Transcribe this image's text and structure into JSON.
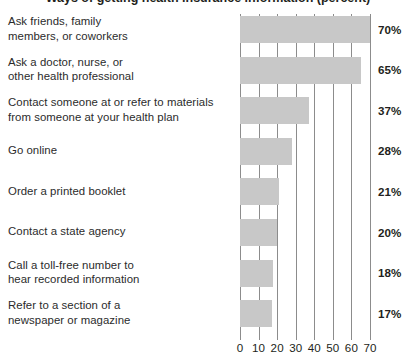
{
  "title": "Ways of getting health insurance information (percent)",
  "chart_data": {
    "type": "bar",
    "orientation": "horizontal",
    "title": "Ways of getting health insurance information (percent)",
    "xlabel": "",
    "ylabel": "",
    "xlim": [
      0,
      70
    ],
    "grid": true,
    "gridlines_x": [
      0,
      10,
      20,
      30,
      40,
      50,
      60,
      70
    ],
    "legend": "none",
    "bar_color": "#c8c8c8",
    "gridline_color": "#8c8c8c",
    "text_color": "#231f20",
    "xticks": [
      "0",
      "10",
      "20",
      "30",
      "40",
      "50",
      "60",
      "70"
    ],
    "categories": [
      "Ask friends, family members, or coworkers",
      "Ask a doctor, nurse, or other health professional",
      "Contact someone at or refer to materials from someone at your health plan",
      "Go online",
      "Order a printed booklet",
      "Contact a state agency",
      "Call a toll-free number to hear recorded information",
      "Refer to a section of a newspaper or magazine"
    ],
    "values": [
      70,
      65,
      37,
      28,
      21,
      20,
      18,
      17
    ],
    "value_labels": [
      "70%",
      "65%",
      "37%",
      "28%",
      "21%",
      "20%",
      "18%",
      "17%"
    ]
  },
  "rows": [
    {
      "label_lines": [
        "Ask friends, family",
        "members, or coworkers"
      ],
      "value": 70,
      "value_label": "70%"
    },
    {
      "label_lines": [
        "Ask a doctor, nurse, or",
        "other health professional"
      ],
      "value": 65,
      "value_label": "65%"
    },
    {
      "label_lines": [
        "Contact someone at or refer to materials",
        "from someone at your health plan"
      ],
      "value": 37,
      "value_label": "37%"
    },
    {
      "label_lines": [
        "Go online"
      ],
      "value": 28,
      "value_label": "28%"
    },
    {
      "label_lines": [
        "Order a printed booklet"
      ],
      "value": 21,
      "value_label": "21%"
    },
    {
      "label_lines": [
        "Contact a state agency"
      ],
      "value": 20,
      "value_label": "20%"
    },
    {
      "label_lines": [
        "Call a toll-free number to",
        "hear recorded information"
      ],
      "value": 18,
      "value_label": "18%"
    },
    {
      "label_lines": [
        "Refer to a section of a",
        "newspaper or magazine"
      ],
      "value": 17,
      "value_label": "17%"
    }
  ]
}
